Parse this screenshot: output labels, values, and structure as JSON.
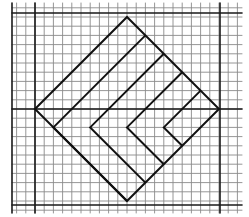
{
  "diagram": {
    "colors": {
      "background": "#ffffff",
      "grid_thin": "#8a8a8a",
      "grid_bold": "#1a1a1a",
      "figure": "#111111"
    },
    "grid": {
      "cell_px": 9.2,
      "origin_px": [
        35,
        109
      ],
      "x_range": [
        12,
        242
      ],
      "y_range": [
        3,
        213
      ],
      "thin_cols": [
        -2,
        22
      ],
      "thin_rows": [
        -11,
        11
      ],
      "bold_vertical_px": [
        12,
        35,
        220
      ],
      "bold_horizontal_px": [
        13,
        109,
        205
      ]
    },
    "diamond": {
      "vertices_grid": [
        [
          0,
          0
        ],
        [
          10,
          -10
        ],
        [
          20,
          0
        ],
        [
          10,
          10
        ]
      ]
    },
    "chevrons": [
      {
        "upper_end": [
          12,
          -8
        ],
        "vertex": [
          2,
          2
        ],
        "lower_end": [
          10,
          10
        ]
      },
      {
        "upper_end": [
          14,
          -6
        ],
        "vertex": [
          6,
          2
        ],
        "lower_end": [
          12,
          8
        ]
      },
      {
        "upper_end": [
          16,
          -4
        ],
        "vertex": [
          10,
          2
        ],
        "lower_end": [
          14,
          6
        ]
      },
      {
        "upper_end": [
          18,
          -2
        ],
        "vertex": [
          14,
          2
        ],
        "lower_end": [
          16,
          4
        ]
      }
    ]
  }
}
